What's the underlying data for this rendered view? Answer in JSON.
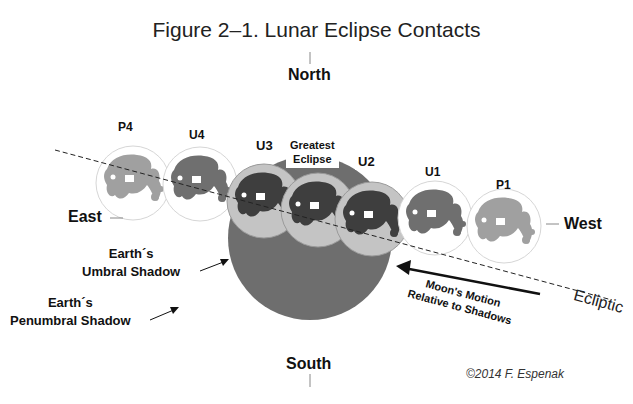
{
  "figure": {
    "title": "Figure 2–1. Lunar Eclipse Contacts",
    "credit": "©2014 F. Espenak"
  },
  "directions": {
    "north": "North",
    "south": "South",
    "east": "East",
    "west": "West"
  },
  "contacts": [
    {
      "id": "P4",
      "label": "P4",
      "shade": "penumbral"
    },
    {
      "id": "U4",
      "label": "U4",
      "shade": "partial"
    },
    {
      "id": "U3",
      "label": "U3",
      "shade": "umbral"
    },
    {
      "id": "GE",
      "label": "Greatest Eclipse",
      "shade": "umbral"
    },
    {
      "id": "U2",
      "label": "U2",
      "shade": "umbral"
    },
    {
      "id": "U1",
      "label": "U1",
      "shade": "partial"
    },
    {
      "id": "P1",
      "label": "P1",
      "shade": "penumbral"
    }
  ],
  "greatest_eclipse": {
    "line1": "Greatest",
    "line2": "Eclipse"
  },
  "shadows": {
    "umbral": {
      "line1": "Earth´s",
      "line2": "Umbral Shadow"
    },
    "penumbral": {
      "line1": "Earth´s",
      "line2": "Penumbral Shadow"
    }
  },
  "motion": {
    "line1": "Moon's Motion",
    "line2": "Relative to Shadows"
  },
  "ecliptic_label": "Ecliptic",
  "colors": {
    "umbra": "#6e6e6e",
    "moon_disk": "#c8c8c8",
    "maria_penumbral": "#9a9a9a",
    "maria_partial": "#6f6f6f",
    "maria_umbral": "#3e3e3e",
    "text": "#111111"
  }
}
